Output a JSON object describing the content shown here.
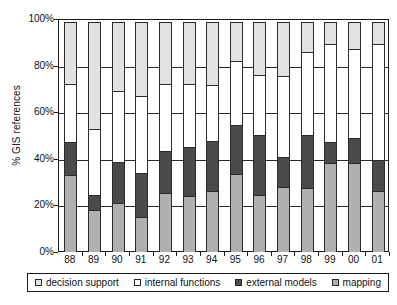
{
  "chart_data": {
    "type": "bar",
    "subtype": "stacked-bar-100-percent",
    "title": "",
    "xlabel": "",
    "ylabel": "% GIS references",
    "ylim": [
      0,
      100
    ],
    "y_ticks": [
      0,
      20,
      40,
      60,
      80,
      100
    ],
    "y_tick_labels": [
      "0%",
      "20%",
      "40%",
      "60%",
      "80%",
      "100%"
    ],
    "grid": true,
    "legend_position": "bottom",
    "stack_order_bottom_to_top": [
      "mapping",
      "external models",
      "internal functions",
      "decision support"
    ],
    "categories": [
      "88",
      "89",
      "90",
      "91",
      "92",
      "93",
      "94",
      "95",
      "96",
      "97",
      "98",
      "99",
      "00",
      "01"
    ],
    "series": [
      {
        "name": "mapping",
        "color": "#b0b0b0",
        "values": [
          33,
          18,
          21,
          15,
          25.5,
          24,
          26,
          33.5,
          24.5,
          28,
          27.5,
          38,
          38,
          26
        ]
      },
      {
        "name": "external models",
        "color": "#4a4a4a",
        "values": [
          14.5,
          7,
          18,
          19.5,
          18.5,
          21.5,
          22,
          21.5,
          26,
          13,
          23,
          9.5,
          11.5,
          14
        ]
      },
      {
        "name": "internal functions",
        "color": "#ffffff",
        "values": [
          25.5,
          28.5,
          31,
          33.5,
          29,
          27.5,
          24.5,
          28,
          26.5,
          35.5,
          36,
          42.5,
          38.5,
          50
        ]
      },
      {
        "name": "decision support",
        "color": "#e2e2e2",
        "values": [
          27,
          46.5,
          30,
          32,
          27,
          27,
          27.5,
          17,
          23,
          23.5,
          13.5,
          10,
          12,
          10
        ]
      }
    ],
    "cumulative_tops": {
      "mapping": [
        33,
        18,
        21,
        15,
        25.5,
        24,
        26,
        33.5,
        24.5,
        28,
        27.5,
        38,
        38,
        26
      ],
      "external models": [
        47.5,
        25,
        39,
        34.5,
        44,
        45.5,
        48,
        55,
        50.5,
        41,
        50.5,
        47.5,
        49.5,
        40
      ],
      "internal functions": [
        73,
        53.5,
        70,
        68,
        73,
        73,
        72.5,
        83,
        77,
        76.5,
        86.5,
        90,
        88,
        90
      ],
      "decision support": [
        100,
        100,
        100,
        100,
        100,
        100,
        100,
        100,
        100,
        100,
        100,
        100,
        100,
        100
      ]
    }
  },
  "legend": {
    "items": [
      {
        "label": "decision support",
        "swatch": "decision"
      },
      {
        "label": "internal functions",
        "swatch": "internal"
      },
      {
        "label": "external models",
        "swatch": "external"
      },
      {
        "label": "mapping",
        "swatch": "mapping"
      }
    ]
  },
  "colors": {
    "mapping": "#b0b0b0",
    "external_models": "#4a4a4a",
    "internal_functions": "#ffffff",
    "decision_support": "#e2e2e2",
    "axis": "#1a1a1a",
    "grid": "#2b2b2b",
    "background": "#ffffff"
  }
}
